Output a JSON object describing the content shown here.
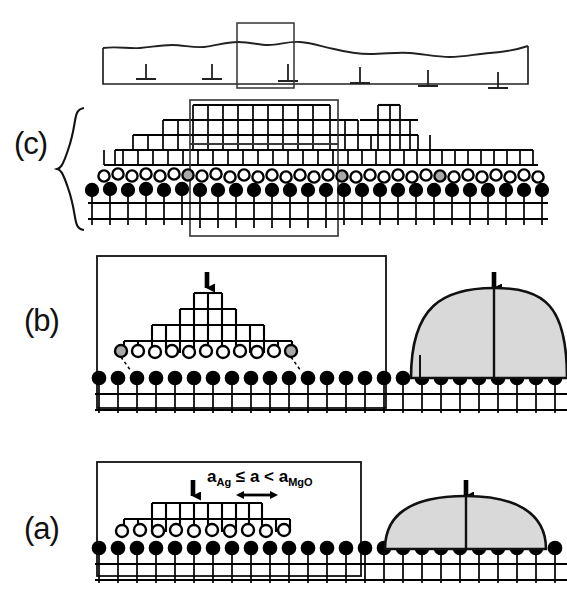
{
  "figure": {
    "kind": "schematic-diagram",
    "background": "#ffffff",
    "ink": "#000000",
    "dome_fill": "#d9d9d9",
    "gray_atom_fill": "#a8a8a8"
  },
  "panels": [
    {
      "id": "c",
      "label": "(c)",
      "has_brace": true,
      "description": "Thick coalesced film with misfit dislocations and stepped terraces",
      "dislocation_symbol": "⊥",
      "dislocation_count": 6,
      "inset_boxes": 3
    },
    {
      "id": "b",
      "label": "(b)",
      "description": "Pyramidal multilayer island (left) and shaded dome cap (right)",
      "pyramid_levels": 4,
      "arrow_symbol": "↓",
      "arrow_count": 2
    },
    {
      "id": "a",
      "label": "(a)",
      "description": "Flat two-level mesa island (left) and shaded dome (right)",
      "pyramid_levels": 2,
      "arrow_symbol": "↓",
      "arrow_count": 2,
      "annotation": {
        "text": "a_Ag ≤ a < a_MgO",
        "parts": [
          {
            "base": "a",
            "sub": "Ag"
          },
          {
            "op": "≤"
          },
          {
            "base": "a"
          },
          {
            "op": "<"
          },
          {
            "base": "a",
            "sub": "MgO"
          }
        ],
        "scale_marker": "double-headed-arrow"
      }
    }
  ],
  "legend": {
    "filled_circle": "substrate / interface atom",
    "open_circle": "deposited adatom",
    "gray_circle": "edge or defect atom"
  }
}
